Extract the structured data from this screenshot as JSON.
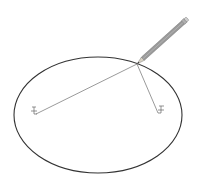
{
  "diagram": {
    "kind": "ellipse-construction-with-pins-and-string",
    "colors": {
      "background": "#ffffff",
      "ellipse": "#333333",
      "string": "#555555",
      "pencil_body": "#9a9a9a",
      "pencil_edge": "#6e6e6e",
      "pin": "#666666"
    },
    "ellipse": {
      "cx": 98,
      "cy": 115,
      "rx": 84,
      "ry": 58
    },
    "pencil_tip": {
      "x": 137,
      "y": 64
    },
    "pencil_end": {
      "x": 187,
      "y": 19
    },
    "pins": [
      {
        "name": "left-focus-pin",
        "x": 34,
        "y": 112
      },
      {
        "name": "right-focus-pin",
        "x": 161,
        "y": 110
      }
    ]
  }
}
